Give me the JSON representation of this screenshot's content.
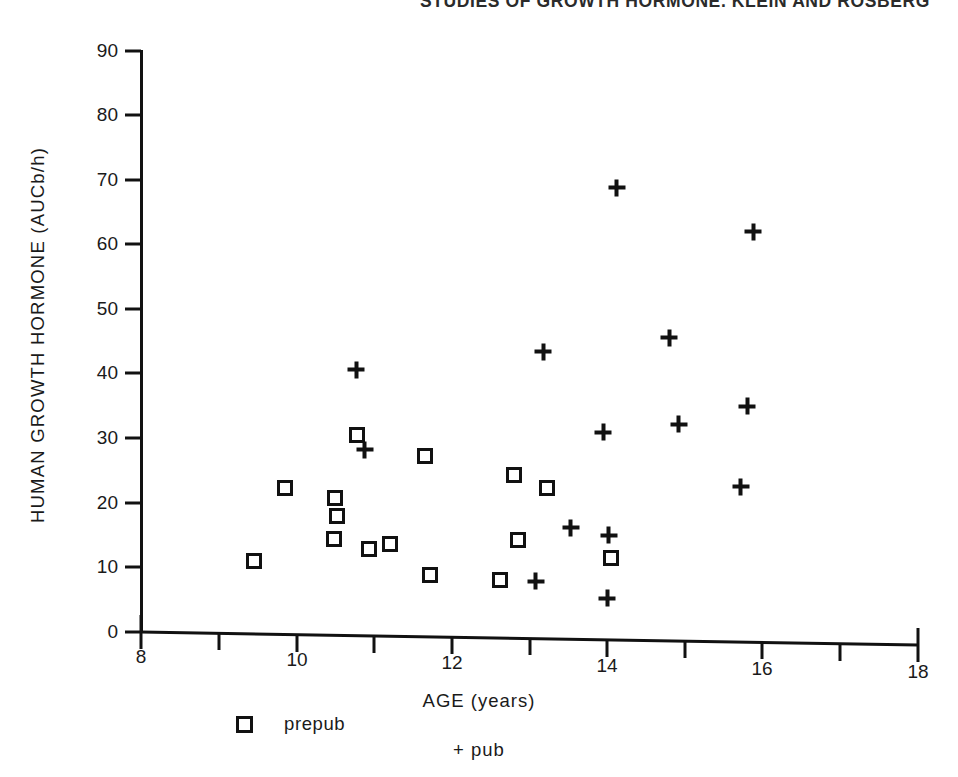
{
  "running_head": "STUDIES OF GROWTH HORMONE. KLEIN AND ROSBERG",
  "chart_data": {
    "type": "scatter",
    "title": "",
    "xlabel": "AGE (years)",
    "ylabel": "HUMAN GROWTH HORMONE (AUCb/h)",
    "xlim": [
      8,
      18
    ],
    "ylim": [
      0,
      90
    ],
    "xticks": [
      8,
      10,
      12,
      14,
      16,
      18
    ],
    "xtick_labels": [
      "8",
      "10",
      "12",
      "14",
      "16",
      "18"
    ],
    "xtick_minor_step": 1,
    "yticks": [
      0,
      10,
      20,
      30,
      40,
      50,
      60,
      70,
      80,
      90
    ],
    "ytick_labels": [
      "0",
      "10",
      "20",
      "30",
      "40",
      "50",
      "60",
      "70",
      "80",
      "90"
    ],
    "grid": false,
    "legend_position": "below-axis",
    "series": [
      {
        "name": "prepub",
        "marker": "open-square",
        "color": "#111111",
        "points": [
          {
            "x": 9.46,
            "y": 11.2
          },
          {
            "x": 9.85,
            "y": 22.6
          },
          {
            "x": 10.5,
            "y": 21.3
          },
          {
            "x": 10.52,
            "y": 18.5
          },
          {
            "x": 10.48,
            "y": 14.9
          },
          {
            "x": 10.78,
            "y": 31.0
          },
          {
            "x": 10.93,
            "y": 13.4
          },
          {
            "x": 11.2,
            "y": 14.2
          },
          {
            "x": 11.66,
            "y": 27.9
          },
          {
            "x": 11.72,
            "y": 9.5
          },
          {
            "x": 12.62,
            "y": 8.9
          },
          {
            "x": 12.8,
            "y": 25.2
          },
          {
            "x": 12.85,
            "y": 15.2
          },
          {
            "x": 13.22,
            "y": 23.3
          },
          {
            "x": 14.05,
            "y": 12.7
          }
        ]
      },
      {
        "name": "pub",
        "marker": "plus",
        "color": "#111111",
        "points": [
          {
            "x": 10.77,
            "y": 41.1
          },
          {
            "x": 10.88,
            "y": 28.8
          },
          {
            "x": 13.08,
            "y": 8.9
          },
          {
            "x": 13.18,
            "y": 44.4
          },
          {
            "x": 13.53,
            "y": 17.2
          },
          {
            "x": 13.95,
            "y": 32.1
          },
          {
            "x": 14.02,
            "y": 16.2
          },
          {
            "x": 14.0,
            "y": 6.4
          },
          {
            "x": 14.12,
            "y": 69.9
          },
          {
            "x": 14.8,
            "y": 46.9
          },
          {
            "x": 14.92,
            "y": 33.5
          },
          {
            "x": 15.72,
            "y": 24.0
          },
          {
            "x": 15.8,
            "y": 36.5
          },
          {
            "x": 15.88,
            "y": 63.5
          }
        ]
      }
    ],
    "legend_entries": [
      {
        "marker": "open-square",
        "label": "prepub"
      },
      {
        "marker": "plus",
        "label": "pub"
      }
    ]
  }
}
